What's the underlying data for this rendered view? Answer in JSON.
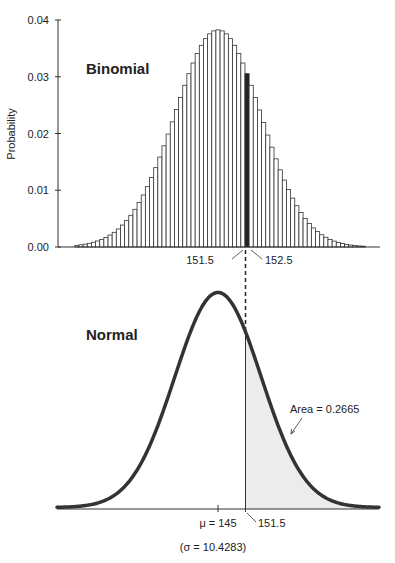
{
  "chart_data": [
    {
      "type": "bar",
      "title": "Binomial",
      "xlabel": "",
      "ylabel": "Probability",
      "ylim": [
        0,
        0.04
      ],
      "yticks": [
        "0.00",
        "0.01",
        "0.02",
        "0.03",
        "0.04"
      ],
      "grid": false,
      "parameters": {
        "n": 580,
        "p": 0.25
      },
      "x_start": 111,
      "categories_note": "k from 111 to 180, one bar per integer",
      "values": [
        0.00029,
        0.00038,
        0.0005,
        0.00065,
        0.00084,
        0.00106,
        0.00134,
        0.00168,
        0.0021,
        0.00259,
        0.00318,
        0.00387,
        0.00467,
        0.00559,
        0.00664,
        0.00783,
        0.00916,
        0.01063,
        0.01224,
        0.01398,
        0.01585,
        0.01783,
        0.0199,
        0.02205,
        0.02422,
        0.02636,
        0.0285,
        0.03054,
        0.03242,
        0.0341,
        0.03554,
        0.03671,
        0.03756,
        0.03808,
        0.03826,
        0.03808,
        0.03756,
        0.03671,
        0.03554,
        0.0341,
        0.03242,
        0.03054,
        0.0285,
        0.02636,
        0.02415,
        0.02193,
        0.01973,
        0.01759,
        0.01554,
        0.0136,
        0.01179,
        0.01013,
        0.00862,
        0.00728,
        0.00608,
        0.00504,
        0.00413,
        0.00336,
        0.00271,
        0.00216,
        0.00171,
        0.00134,
        0.00104,
        0.0008,
        0.00061,
        0.00046,
        0.00034,
        0.00026,
        0.00019,
        0.00014
      ],
      "highlighted_bar": {
        "k": 152,
        "from": 151.5,
        "to": 152.5,
        "color": "#222222"
      },
      "annotations": [
        "151.5",
        "152.5"
      ]
    },
    {
      "type": "area",
      "title": "Normal",
      "mean": 145,
      "sd": 10.4283,
      "shaded_region": {
        "from": 151.5,
        "to": "inf",
        "area": 0.2665,
        "color": "#ececec"
      },
      "annotations": [
        "Area = 0.2665",
        "μ = 145",
        "151.5",
        "(σ = 10.4283)"
      ]
    }
  ],
  "labels": {
    "binomial_title": "Binomial",
    "normal_title": "Normal",
    "ylabel": "Probability",
    "yticks": [
      "0.00",
      "0.01",
      "0.02",
      "0.03",
      "0.04"
    ],
    "lower_bound": "151.5",
    "upper_bound": "152.5",
    "area": "Area = 0.2665",
    "mu": "μ = 145",
    "cutoff": "151.5",
    "sigma": "(σ = 10.4283)"
  }
}
